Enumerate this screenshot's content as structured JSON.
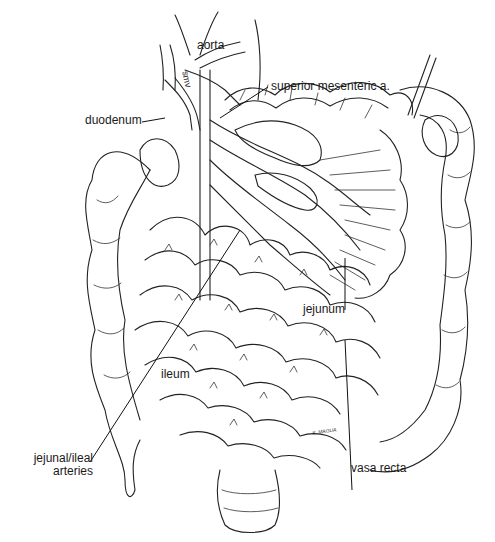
{
  "figure": {
    "labels": {
      "aorta": "aorta",
      "smv": "smv",
      "superior_mesenteric": "superior mesenteric a.",
      "duodenum": "duodenum",
      "jejunum": "jejunum",
      "ileum": "ileum",
      "jejunal_ileal_line1": "jejunal/ileal",
      "jejunal_ileal_line2": "arteries",
      "vasa_recta": "vasa recta",
      "signature": "S. MAGUA"
    },
    "colors": {
      "ink": "#222222",
      "background": "#ffffff"
    }
  }
}
